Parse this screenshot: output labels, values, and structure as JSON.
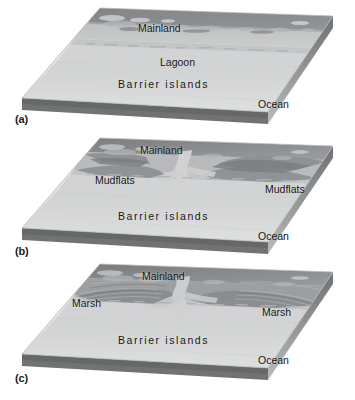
{
  "figure": {
    "background_color": "#ffffff",
    "panel_count": 3
  },
  "colors": {
    "mainland_upland": "#8f9194",
    "mainland_dark": "#76797c",
    "lagoon": "#c6c8c9",
    "barrier": "#d9dadb",
    "ocean": "#e3e4e5",
    "block_side_light": "#bcbebf",
    "block_side_dark": "#6f7174",
    "block_edge": "#a9abad",
    "text": "#141414"
  },
  "panels": [
    {
      "id": "a",
      "panel_label": "(a)",
      "stage_name": "lagoon-stage",
      "labels": [
        {
          "name": "mainland",
          "text": "Mainland"
        },
        {
          "name": "lagoon",
          "text": "Lagoon"
        },
        {
          "name": "barrier-islands",
          "text": "Barrier islands"
        },
        {
          "name": "ocean",
          "text": "Ocean"
        }
      ]
    },
    {
      "id": "b",
      "panel_label": "(b)",
      "stage_name": "mudflats-stage",
      "labels": [
        {
          "name": "mainland",
          "text": "Mainland"
        },
        {
          "name": "mudflats-left",
          "text": "Mudflats"
        },
        {
          "name": "mudflats-right",
          "text": "Mudflats"
        },
        {
          "name": "barrier-islands",
          "text": "Barrier islands"
        },
        {
          "name": "ocean",
          "text": "Ocean"
        }
      ]
    },
    {
      "id": "c",
      "panel_label": "(c)",
      "stage_name": "marsh-stage",
      "labels": [
        {
          "name": "mainland",
          "text": "Mainland"
        },
        {
          "name": "marsh-left",
          "text": "Marsh"
        },
        {
          "name": "marsh-right",
          "text": "Marsh"
        },
        {
          "name": "barrier-islands",
          "text": "Barrier islands"
        },
        {
          "name": "ocean",
          "text": "Ocean"
        }
      ]
    }
  ]
}
